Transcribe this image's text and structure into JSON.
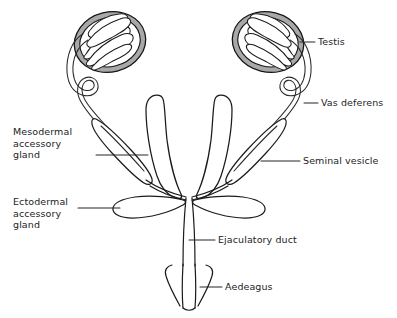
{
  "figure": {
    "background_color": "#ffffff",
    "line_color": "#1b1b1b",
    "text_color": "#232323",
    "testis_shading_color": "#a8a8a8",
    "width": 397,
    "height": 318
  },
  "labels": {
    "testis": "Testis",
    "vas_deferens": "Vas deferens",
    "mesodermal_accessory_gland": "Mesodermal\naccessory\ngland",
    "seminal_vesicle": "Seminal vesicle",
    "ectodermal_accessory_gland": "Ectodermal\naccessory\ngland",
    "ejaculatory_duct": "Ejaculatory duct",
    "aedeagus": "Aedeagus"
  },
  "structures": [
    {
      "name": "testis-left",
      "label": "Testis",
      "side": "left",
      "description": "oval testis with coiled follicles"
    },
    {
      "name": "testis-right",
      "label": "Testis",
      "side": "right",
      "description": "oval testis with coiled follicles"
    },
    {
      "name": "vas-deferens-left",
      "label": "Vas deferens",
      "side": "left",
      "description": "looped duct from testis"
    },
    {
      "name": "vas-deferens-right",
      "label": "Vas deferens",
      "side": "right",
      "description": "looped duct from testis"
    },
    {
      "name": "mesodermal-accessory-gland-left",
      "label": "Mesodermal accessory gland",
      "side": "left",
      "description": "spindle shaped gland"
    },
    {
      "name": "seminal-vesicle-right",
      "label": "Seminal vesicle",
      "side": "right",
      "description": "spindle shaped swelling"
    },
    {
      "name": "seminal-vesicle-central-left",
      "label": "Seminal vesicle",
      "side": "center-left",
      "description": "elongated finger-like tube"
    },
    {
      "name": "seminal-vesicle-central-right",
      "label": "Seminal vesicle",
      "side": "center-right",
      "description": "elongated finger-like tube"
    },
    {
      "name": "ectodermal-accessory-gland-left",
      "label": "Ectodermal accessory gland",
      "side": "left",
      "description": "curved lateral sac"
    },
    {
      "name": "ectodermal-accessory-gland-right",
      "label": "Ectodermal accessory gland",
      "side": "right",
      "description": "curved lateral sac"
    },
    {
      "name": "ejaculatory-duct",
      "label": "Ejaculatory duct",
      "side": "center",
      "description": "vertical median duct"
    },
    {
      "name": "aedeagus",
      "label": "Aedeagus",
      "side": "center",
      "description": "terminal intromittent organ with parameres"
    }
  ]
}
